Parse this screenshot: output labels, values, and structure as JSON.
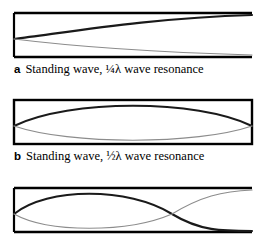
{
  "figure": {
    "background_color": "#ffffff",
    "stroke_dark": "#1a1a1a",
    "stroke_light": "#8c8c8c",
    "box_stroke": "#000000"
  },
  "panels": [
    {
      "letter": "a",
      "caption": "Standing wave, ¼λ wave resonance",
      "box": {
        "x": 14,
        "y": 5,
        "width": 238,
        "height": 44,
        "right_open": true
      },
      "wave": {
        "mode": "quarter",
        "node_positions": [
          14
        ],
        "antinode_positions": [
          252
        ]
      }
    },
    {
      "letter": "b",
      "caption": "Standing wave, ½λ wave resonance",
      "box": {
        "x": 14,
        "y": 5,
        "width": 238,
        "height": 44,
        "right_open": false
      },
      "wave": {
        "mode": "half",
        "node_positions": [
          14,
          252
        ],
        "antinode_positions": [
          133
        ]
      }
    },
    {
      "letter": "c",
      "caption": "",
      "box": {
        "x": 14,
        "y": 5,
        "width": 238,
        "height": 44,
        "right_open": true
      },
      "wave": {
        "mode": "three-quarter",
        "node_positions": [
          14,
          172
        ],
        "antinode_positions": [
          93,
          252
        ]
      }
    }
  ]
}
